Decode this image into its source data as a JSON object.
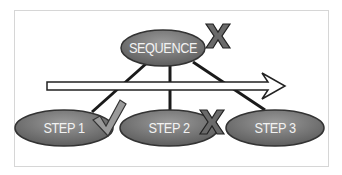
{
  "diagram": {
    "root": {
      "label": "SEQUENCE",
      "mark": "x"
    },
    "steps": [
      {
        "label": "STEP 1",
        "mark": "check"
      },
      {
        "label": "STEP 2",
        "mark": "x"
      },
      {
        "label": "STEP 3",
        "mark": "none"
      }
    ],
    "arrow": "timeline-arrow-right",
    "colors": {
      "node_fill": "#7d7d7d",
      "node_stroke": "#333333",
      "mark_fill": "#6a6a6a",
      "line": "#1a1a1a"
    }
  }
}
